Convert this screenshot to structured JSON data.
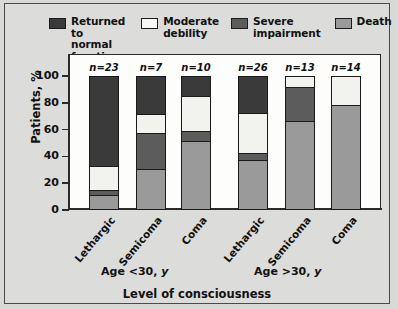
{
  "chart_data": {
    "type": "bar",
    "subtype": "stacked-bar-percent",
    "title": "",
    "xlabel": "Level of consciousness",
    "ylabel": "Patients, %",
    "ylim": [
      0,
      100
    ],
    "yticks": [
      0,
      20,
      40,
      60,
      80,
      100
    ],
    "ytick_labels": [
      "0",
      "20",
      "40",
      "60",
      "80",
      "100"
    ],
    "grid": false,
    "legend_position": "top",
    "categories": [
      "Lethargic",
      "Semicoma",
      "Coma",
      "Lethargic",
      "Semicoma",
      "Coma"
    ],
    "group_labels": [
      "Age <30, y",
      "Age >30, y"
    ],
    "group_spans": [
      [
        0,
        2
      ],
      [
        3,
        5
      ]
    ],
    "n_labels": [
      "n=23",
      "n=7",
      "n=10",
      "n=26",
      "n=13",
      "n=14"
    ],
    "n_values": [
      23,
      7,
      10,
      26,
      13,
      14
    ],
    "series": [
      {
        "name": "Returned to normal function",
        "color": "#3a3a3a",
        "values": [
          69,
          29,
          15,
          28,
          0,
          0
        ]
      },
      {
        "name": "Moderate debility",
        "color": "#f2f2ee",
        "values": [
          18,
          14,
          26,
          30,
          8,
          21
        ]
      },
      {
        "name": "Severe impairment",
        "color": "#5c5c5c",
        "values": [
          3,
          27,
          7,
          5,
          25,
          0
        ]
      },
      {
        "name": "Death",
        "color": "#9a9a9a",
        "values": [
          10,
          30,
          52,
          37,
          67,
          79
        ]
      }
    ]
  },
  "legend": {
    "items": [
      {
        "label": "Returned to\nnormal function",
        "color": "#3a3a3a",
        "icon": "legend-swatch-icon"
      },
      {
        "label": "Moderate\ndebility",
        "color": "#f7f7f4",
        "icon": "legend-swatch-icon"
      },
      {
        "label": "Severe\nimpairment",
        "color": "#5c5c5c",
        "icon": "legend-swatch-icon"
      },
      {
        "label": "Death",
        "color": "#9a9a9a",
        "icon": "legend-swatch-icon"
      }
    ]
  },
  "colors": {
    "background": "#d9d9d7",
    "panel": "#fdfdfc",
    "frame": "#4a4a4a",
    "axis": "#2a2a2a",
    "text": "#111111"
  }
}
